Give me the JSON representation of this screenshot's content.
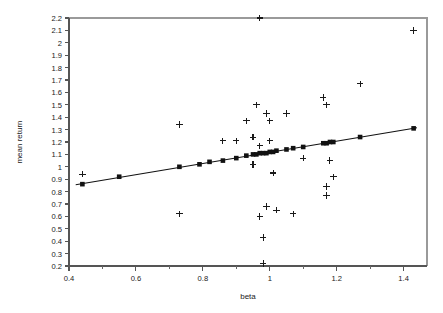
{
  "chart_data": {
    "type": "scatter",
    "title": "",
    "xlabel": "beta",
    "ylabel": "mean return",
    "xlim": [
      0.4,
      1.47
    ],
    "ylim": [
      0.2,
      2.2
    ],
    "grid": false,
    "legend": null,
    "x_ticks_major": [
      0.4,
      0.6,
      0.8,
      1.0,
      1.2,
      1.4
    ],
    "x_tick_labels": [
      "0.4",
      "0.6",
      "0.8",
      "1",
      "1.2",
      "1.4"
    ],
    "x_ticks_minor": [
      0.5,
      0.7,
      0.9,
      1.1,
      1.3
    ],
    "y_ticks": [
      0.2,
      0.3,
      0.4,
      0.5,
      0.6,
      0.7,
      0.8,
      0.9,
      1.0,
      1.1,
      1.2,
      1.3,
      1.4,
      1.5,
      1.6,
      1.7,
      1.8,
      1.9,
      2.0,
      2.1,
      2.2
    ],
    "y_tick_labels": [
      "0.2",
      "0.3",
      "0.4",
      "0.5",
      "0.6",
      "0.7",
      "0.8",
      "0.9",
      "1",
      "1.1",
      "1.2",
      "1.3",
      "1.4",
      "1.5",
      "1.6",
      "1.7",
      "1.8",
      "1.9",
      "2",
      "2.1",
      "2.2"
    ],
    "series": [
      {
        "name": "observed mean return",
        "marker": "cross",
        "color": "#1a1a1a",
        "points": [
          [
            0.44,
            0.94
          ],
          [
            0.73,
            1.34
          ],
          [
            0.73,
            0.62
          ],
          [
            0.86,
            1.21
          ],
          [
            0.9,
            1.21
          ],
          [
            0.93,
            1.37
          ],
          [
            0.95,
            1.24
          ],
          [
            0.95,
            1.02
          ],
          [
            0.96,
            1.5
          ],
          [
            0.97,
            1.17
          ],
          [
            0.97,
            2.2
          ],
          [
            0.97,
            0.6
          ],
          [
            0.98,
            0.22
          ],
          [
            0.98,
            0.43
          ],
          [
            0.99,
            1.43
          ],
          [
            0.99,
            0.68
          ],
          [
            1.0,
            1.37
          ],
          [
            1.0,
            1.21
          ],
          [
            1.01,
            0.95
          ],
          [
            1.02,
            0.65
          ],
          [
            1.05,
            1.43
          ],
          [
            1.07,
            0.62
          ],
          [
            1.1,
            1.07
          ],
          [
            1.16,
            1.56
          ],
          [
            1.17,
            1.5
          ],
          [
            1.17,
            0.84
          ],
          [
            1.17,
            0.77
          ],
          [
            1.18,
            1.05
          ],
          [
            1.19,
            0.92
          ],
          [
            1.27,
            1.67
          ],
          [
            1.43,
            2.1
          ]
        ]
      },
      {
        "name": "fitted mean return",
        "marker": "square",
        "color": "#111111",
        "points": [
          [
            0.44,
            0.86
          ],
          [
            0.55,
            0.92
          ],
          [
            0.73,
            1.0
          ],
          [
            0.79,
            1.02
          ],
          [
            0.82,
            1.04
          ],
          [
            0.86,
            1.05
          ],
          [
            0.9,
            1.07
          ],
          [
            0.93,
            1.09
          ],
          [
            0.95,
            1.1
          ],
          [
            0.96,
            1.1
          ],
          [
            0.97,
            1.11
          ],
          [
            0.98,
            1.11
          ],
          [
            0.99,
            1.11
          ],
          [
            1.0,
            1.12
          ],
          [
            1.01,
            1.12
          ],
          [
            1.02,
            1.13
          ],
          [
            1.05,
            1.14
          ],
          [
            1.07,
            1.15
          ],
          [
            1.1,
            1.16
          ],
          [
            1.16,
            1.19
          ],
          [
            1.17,
            1.19
          ],
          [
            1.18,
            1.2
          ],
          [
            1.19,
            1.2
          ],
          [
            1.27,
            1.24
          ],
          [
            1.43,
            1.31
          ]
        ]
      }
    ],
    "fit_line": {
      "name": "regression line",
      "x_start": 0.42,
      "y_start": 0.855,
      "x_end": 1.44,
      "y_end": 1.315
    }
  }
}
